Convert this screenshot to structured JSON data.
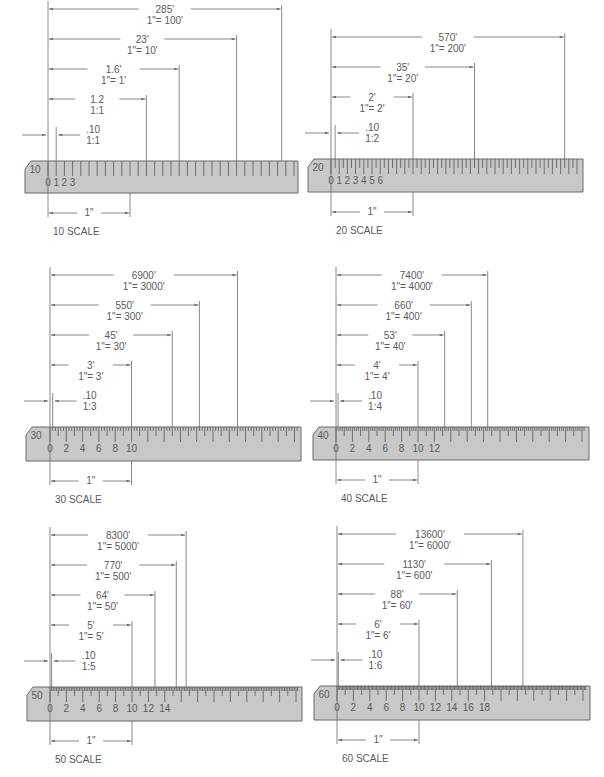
{
  "figure": {
    "colors": {
      "ruler_fill": "#c8c8c8",
      "ruler_stroke": "#6a6a6a",
      "line": "#6a6a6a",
      "text": "#5a5a5a",
      "background": "#ffffff"
    },
    "panels": [
      {
        "id": "scale-10",
        "scale_label": "10  SCALE",
        "ruler_mark": "10",
        "divisions_per_inch": 10,
        "major_labels": [
          "0",
          "1",
          "2",
          "3"
        ],
        "major_step": 1,
        "inch_label": "1\"",
        "origin": {
          "x": 48,
          "ruler_top": 161,
          "ruler_bottom": 193,
          "ruler_left": 25,
          "ruler_right": 298,
          "px_per_inch": 82
        },
        "readings": [
          {
            "value": "285'",
            "ratio": "1\"=  100'",
            "inches": 2.85
          },
          {
            "value": "23'",
            "ratio": "1\"=  10'",
            "inches": 2.3
          },
          {
            "value": "1.6'",
            "ratio": "1\"=  1'",
            "inches": 1.6
          },
          {
            "value": "1.2",
            "ratio": "1:1",
            "inches": 1.2
          },
          {
            "value": ".10",
            "ratio": "1:1",
            "inches": 0.1
          }
        ]
      },
      {
        "id": "scale-20",
        "scale_label": "20  SCALE",
        "ruler_mark": "20",
        "divisions_per_inch": 20,
        "major_labels": [
          "0",
          "1",
          "2",
          "3",
          "4",
          "5",
          "6"
        ],
        "major_step": 2,
        "inch_label": "1\"",
        "origin": {
          "x": 331,
          "ruler_top": 159,
          "ruler_bottom": 192,
          "ruler_left": 308,
          "ruler_right": 583,
          "px_per_inch": 82
        },
        "readings": [
          {
            "value": "570'",
            "ratio": "1\"=  200'",
            "inches": 2.85
          },
          {
            "value": "35'",
            "ratio": "1\"=  20'",
            "inches": 1.75
          },
          {
            "value": "2'",
            "ratio": "1\"=  2'",
            "inches": 1.0
          },
          {
            "value": ".10",
            "ratio": "1:2",
            "inches": 0.05
          }
        ]
      },
      {
        "id": "scale-30",
        "scale_label": "30  SCALE",
        "ruler_mark": "30",
        "divisions_per_inch": 30,
        "major_labels": [
          "0",
          "2",
          "4",
          "6",
          "8",
          "10"
        ],
        "major_step": 6,
        "inch_label": "1\"",
        "origin": {
          "x": 50,
          "ruler_top": 427,
          "ruler_bottom": 461,
          "ruler_left": 26,
          "ruler_right": 301,
          "px_per_inch": 81.5
        },
        "readings": [
          {
            "value": "6900'",
            "ratio": "1\"=  3000'",
            "inches": 2.3
          },
          {
            "value": "550'",
            "ratio": "1\"=  300'",
            "inches": 1.833
          },
          {
            "value": "45'",
            "ratio": "1\"=  30'",
            "inches": 1.5
          },
          {
            "value": "3'",
            "ratio": "1\"=  3'",
            "inches": 1.0
          },
          {
            "value": ".10",
            "ratio": "1:3",
            "inches": 0.0333
          }
        ]
      },
      {
        "id": "scale-40",
        "scale_label": "40  SCALE",
        "ruler_mark": "40",
        "divisions_per_inch": 40,
        "major_labels": [
          "0",
          "2",
          "4",
          "6",
          "8",
          "10",
          "12"
        ],
        "major_step": 8,
        "inch_label": "1\"",
        "origin": {
          "x": 336,
          "ruler_top": 427,
          "ruler_bottom": 460,
          "ruler_left": 313,
          "ruler_right": 589,
          "px_per_inch": 82
        },
        "readings": [
          {
            "value": "7400'",
            "ratio": "1\"=  4000'",
            "inches": 1.85
          },
          {
            "value": "660'",
            "ratio": "1\"=  400'",
            "inches": 1.65
          },
          {
            "value": "53'",
            "ratio": "1\"=  40'",
            "inches": 1.325
          },
          {
            "value": "4'",
            "ratio": "1\"=  4'",
            "inches": 1.0
          },
          {
            "value": ".10",
            "ratio": "1:4",
            "inches": 0.025
          }
        ]
      },
      {
        "id": "scale-50",
        "scale_label": "50  SCALE",
        "ruler_mark": "50",
        "divisions_per_inch": 50,
        "major_labels": [
          "0",
          "2",
          "4",
          "6",
          "8",
          "10",
          "12",
          "14"
        ],
        "major_step": 10,
        "inch_label": "1\"",
        "origin": {
          "x": 50,
          "ruler_top": 687,
          "ruler_bottom": 721,
          "ruler_left": 27,
          "ruler_right": 302,
          "px_per_inch": 82
        },
        "readings": [
          {
            "value": "8300'",
            "ratio": "1\"=  5000'",
            "inches": 1.66
          },
          {
            "value": "770'",
            "ratio": "1\"=  500'",
            "inches": 1.54
          },
          {
            "value": "64'",
            "ratio": "1\"=  50'",
            "inches": 1.28
          },
          {
            "value": "5'",
            "ratio": "1\"=  5'",
            "inches": 1.0
          },
          {
            "value": ".10",
            "ratio": "1:5",
            "inches": 0.02
          }
        ]
      },
      {
        "id": "scale-60",
        "scale_label": "60  SCALE",
        "ruler_mark": "60",
        "divisions_per_inch": 60,
        "major_labels": [
          "0",
          "2",
          "4",
          "6",
          "8",
          "10",
          "12",
          "14",
          "16",
          "18"
        ],
        "major_step": 12,
        "inch_label": "1\"",
        "origin": {
          "x": 337,
          "ruler_top": 686,
          "ruler_bottom": 720,
          "ruler_left": 314,
          "ruler_right": 590,
          "px_per_inch": 82
        },
        "readings": [
          {
            "value": "13600'",
            "ratio": "1\"=  6000'",
            "inches": 2.267
          },
          {
            "value": "1130'",
            "ratio": "1\"=  600'",
            "inches": 1.883
          },
          {
            "value": "88'",
            "ratio": "1\"=  60'",
            "inches": 1.467
          },
          {
            "value": "6'",
            "ratio": "1\"=  6'",
            "inches": 1.0
          },
          {
            "value": ".10",
            "ratio": "1:6",
            "inches": 0.0167
          }
        ]
      }
    ]
  }
}
